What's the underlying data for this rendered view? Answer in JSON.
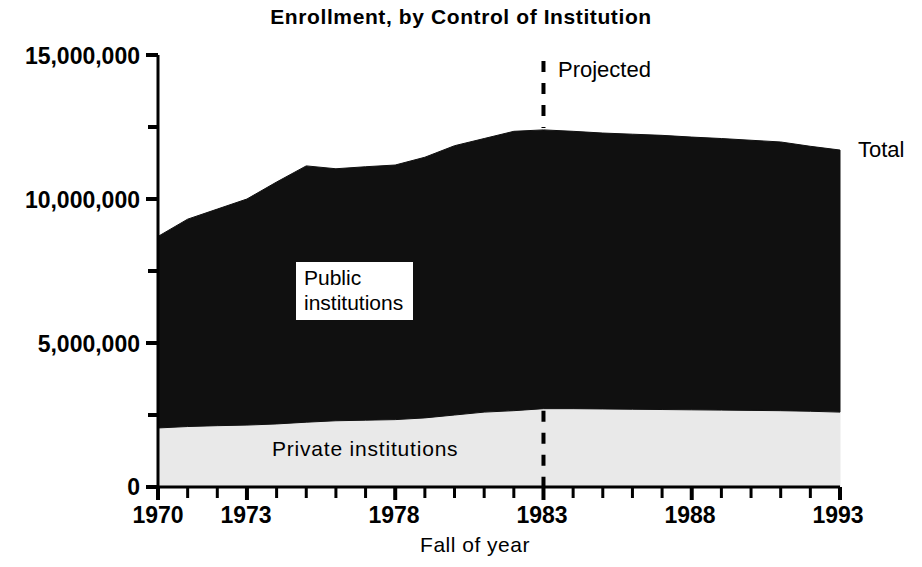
{
  "chart_data": {
    "type": "area",
    "title": "Enrollment, by Control of Institution",
    "xlabel": "Fall of year",
    "ylabel": "",
    "xlim": [
      1970,
      1993
    ],
    "ylim": [
      0,
      15000000
    ],
    "grid": false,
    "legend_position": "inline-annotations",
    "stacked": true,
    "x": [
      1970,
      1971,
      1972,
      1973,
      1974,
      1975,
      1976,
      1977,
      1978,
      1979,
      1980,
      1981,
      1982,
      1983,
      1984,
      1985,
      1986,
      1987,
      1988,
      1989,
      1990,
      1991,
      1992,
      1993
    ],
    "series": [
      {
        "name": "Private institutions",
        "values": [
          2050000,
          2100000,
          2130000,
          2150000,
          2190000,
          2250000,
          2300000,
          2320000,
          2340000,
          2400000,
          2500000,
          2600000,
          2650000,
          2720000,
          2720000,
          2710000,
          2700000,
          2690000,
          2680000,
          2670000,
          2660000,
          2650000,
          2630000,
          2600000
        ]
      },
      {
        "name": "Public institutions",
        "values": [
          6650000,
          7200000,
          7520000,
          7850000,
          8400000,
          8900000,
          8750000,
          8800000,
          8840000,
          9050000,
          9350000,
          9500000,
          9700000,
          9680000,
          9630000,
          9580000,
          9550000,
          9520000,
          9470000,
          9430000,
          9380000,
          9330000,
          9200000,
          9100000
        ]
      }
    ],
    "total": {
      "name": "Total",
      "values": [
        8700000,
        9300000,
        9650000,
        10000000,
        10590000,
        11150000,
        11050000,
        11120000,
        11180000,
        11450000,
        11850000,
        12100000,
        12350000,
        12400000,
        12350000,
        12290000,
        12250000,
        12210000,
        12150000,
        12100000,
        12040000,
        11980000,
        11830000,
        11700000
      ]
    },
    "ytick_labels": [
      "15,000,000",
      "10,000,000",
      "5,000,000",
      "0"
    ],
    "ytick_values": [
      15000000,
      10000000,
      5000000,
      0
    ],
    "yminor_values": [
      12500000,
      7500000,
      2500000
    ],
    "xtick_labels": [
      "1970",
      "1973",
      "1978",
      "1983",
      "1988",
      "1993"
    ],
    "xtick_values": [
      1970,
      1973,
      1978,
      1983,
      1988,
      1993
    ],
    "annotations": [
      {
        "name": "projected-divider",
        "text": "Projected",
        "at_x": 1983,
        "style": "dashed-vertical-line"
      },
      {
        "name": "total-label",
        "text": "Total",
        "at_x": 1993
      },
      {
        "name": "public-label",
        "text": "Public\ninstitutions"
      },
      {
        "name": "private-label",
        "text": "Private  institutions"
      }
    ],
    "colors": {
      "public_fill": "#101010",
      "private_fill": "#e9e9e9",
      "axis": "#000000",
      "background": "#ffffff"
    }
  },
  "labels": {
    "title": "Enrollment, by Control of Institution",
    "xaxis_title": "Fall of year",
    "public_line1": "Public",
    "public_line2": "institutions",
    "private": "Private  institutions",
    "projected": "Projected",
    "total": "Total",
    "ytick_0": "15,000,000",
    "ytick_1": "10,000,000",
    "ytick_2": "5,000,000",
    "ytick_3": "0",
    "xtick_0": "1970",
    "xtick_1": "1973",
    "xtick_2": "1978",
    "xtick_3": "1983",
    "xtick_4": "1988",
    "xtick_5": "1993"
  }
}
